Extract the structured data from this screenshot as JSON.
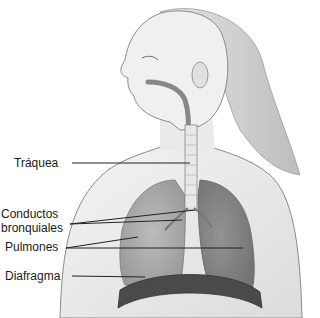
{
  "diagram": {
    "labels": [
      {
        "id": "trachea",
        "text": "Tráquea",
        "x": 14,
        "y": 156
      },
      {
        "id": "bronchi_line1",
        "text": "Conductos",
        "x": 1,
        "y": 207
      },
      {
        "id": "bronchi_line2",
        "text": "bronquiales",
        "x": 1,
        "y": 221
      },
      {
        "id": "lungs",
        "text": "Pulmones",
        "x": 5,
        "y": 240
      },
      {
        "id": "diaphragm",
        "text": "Diafragma",
        "x": 5,
        "y": 269
      }
    ],
    "leaders": [
      {
        "for": "trachea",
        "x1": 72,
        "y1": 163,
        "x2": 190,
        "y2": 163
      },
      {
        "for": "bronchi",
        "x1": 70,
        "y1": 224,
        "x2": 195,
        "y2": 210
      },
      {
        "for": "bronchi",
        "x1": 70,
        "y1": 224,
        "x2": 182,
        "y2": 220
      },
      {
        "for": "lungs",
        "x1": 66,
        "y1": 248,
        "x2": 138,
        "y2": 237
      },
      {
        "for": "lungs",
        "x1": 66,
        "y1": 248,
        "x2": 243,
        "y2": 248
      },
      {
        "for": "diaphragm",
        "x1": 72,
        "y1": 276,
        "x2": 145,
        "y2": 277
      }
    ],
    "colors": {
      "line": "#222222",
      "skin_outline": "#8a8a8a",
      "lung_fill": "#9a9a9a",
      "lung_dark": "#6e6e6e",
      "diaphragm": "#4a4a4a",
      "hair": "#d0d0d0"
    }
  }
}
